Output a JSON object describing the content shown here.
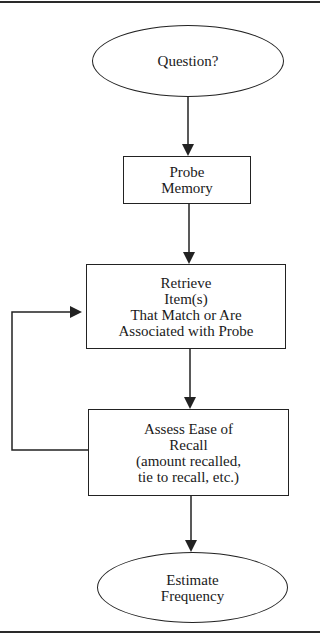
{
  "diagram": {
    "type": "flowchart",
    "nodes": [
      {
        "id": "question",
        "shape": "ellipse",
        "label": "Question?"
      },
      {
        "id": "probe",
        "shape": "rectangle",
        "label": "Probe\nMemory"
      },
      {
        "id": "retrieve",
        "shape": "rectangle",
        "label": "Retrieve\nItem(s)\nThat Match or Are\nAssociated with Probe"
      },
      {
        "id": "assess",
        "shape": "rectangle",
        "label": "Assess Ease of\nRecall\n(amount recalled,\ntie to recall, etc.)"
      },
      {
        "id": "estimate",
        "shape": "ellipse",
        "label": "Estimate\nFrequency"
      }
    ],
    "edges": [
      {
        "from": "question",
        "to": "probe"
      },
      {
        "from": "probe",
        "to": "retrieve"
      },
      {
        "from": "retrieve",
        "to": "assess"
      },
      {
        "from": "assess",
        "to": "estimate"
      },
      {
        "from": "assess",
        "to": "retrieve",
        "type": "feedback-loop"
      }
    ],
    "colors": {
      "stroke": "#222222",
      "fill": "#ffffff",
      "text": "#1a1a1a"
    }
  }
}
